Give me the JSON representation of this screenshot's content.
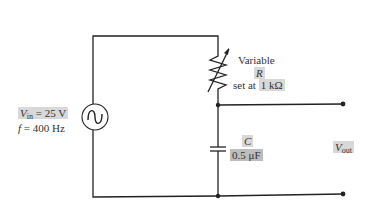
{
  "source": {
    "symbol": "ac-voltage-source",
    "vin_symbol": "V",
    "vin_subscript": "in",
    "vin_value": "= 25 V",
    "freq_symbol": "f",
    "freq_value": "= 400 Hz"
  },
  "resistor": {
    "line1": "Variable",
    "symbol": "R",
    "prefix": "set at",
    "value": "1 kΩ"
  },
  "capacitor": {
    "symbol": "C",
    "value": "0.5 μF"
  },
  "output": {
    "symbol": "V",
    "subscript": "out"
  },
  "colors": {
    "wire": "#222222",
    "label_highlight": "#d8d8d8",
    "value_highlight": "#bdbdbd"
  }
}
